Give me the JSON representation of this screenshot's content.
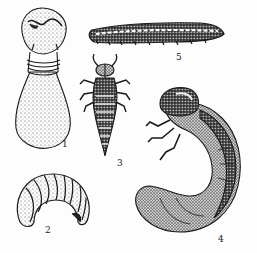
{
  "figure": {
    "ink_color": "#1a1a1a",
    "background": "#fdfdfd",
    "specimens": [
      {
        "id": 1,
        "label": "1",
        "form": "pupa (upright, flask-shaped with ringed neck)"
      },
      {
        "id": 2,
        "label": "2",
        "form": "C-shaped grub, curled, segmented"
      },
      {
        "id": 3,
        "label": "3",
        "form": "campodeiform larva, dorsal view with six legs"
      },
      {
        "id": 4,
        "label": "4",
        "form": "scarabaeiform grub, curled, lateral view"
      },
      {
        "id": 5,
        "label": "5",
        "form": "elongate caterpillar-like larva, lateral view"
      }
    ]
  }
}
